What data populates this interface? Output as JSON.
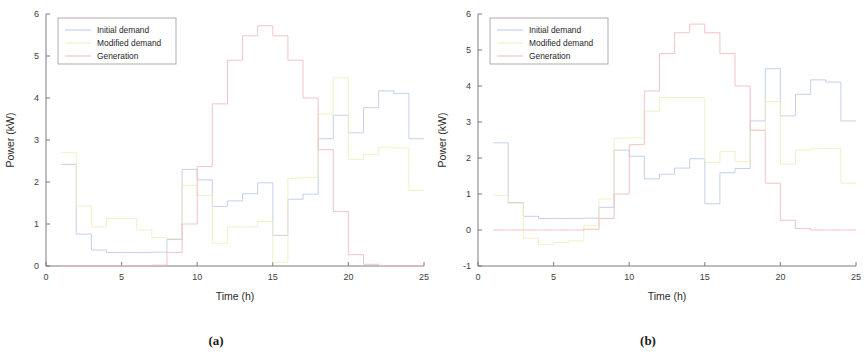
{
  "figure": {
    "panels": [
      {
        "caption": "(a)",
        "xlabel": "Time (h)",
        "ylabel": "Power (kW)",
        "xticks": [
          "0",
          "5",
          "10",
          "15",
          "20",
          "25"
        ],
        "yticks": [
          "0",
          "1",
          "2",
          "3",
          "4",
          "5",
          "6"
        ]
      },
      {
        "caption": "(b)",
        "xlabel": "Time (h)",
        "ylabel": "Power (kW)",
        "xticks": [
          "0",
          "5",
          "10",
          "15",
          "20",
          "25"
        ],
        "yticks": [
          "-1",
          "0",
          "1",
          "2",
          "3",
          "4",
          "5",
          "6"
        ]
      }
    ],
    "legend": {
      "entries": [
        {
          "label": "Initial demand",
          "color": "#b9c8e8"
        },
        {
          "label": "Modified demand",
          "color": "#eeedbe"
        },
        {
          "label": "Generation",
          "color": "#eeb9bb"
        }
      ]
    }
  },
  "chart_data": [
    {
      "type": "line",
      "title": "(a)",
      "xlabel": "Time (h)",
      "ylabel": "Power (kW)",
      "xlim": [
        0,
        25
      ],
      "ylim": [
        0,
        6
      ],
      "xticks": [
        0,
        5,
        10,
        15,
        20,
        25
      ],
      "yticks": [
        0,
        1,
        2,
        3,
        4,
        5,
        6
      ],
      "grid": false,
      "legend_position": "upper-left",
      "step_style": "post",
      "x": [
        1,
        2,
        3,
        4,
        5,
        6,
        7,
        8,
        9,
        10,
        11,
        12,
        13,
        14,
        15,
        16,
        17,
        18,
        19,
        20,
        21,
        22,
        23,
        24
      ],
      "series": [
        {
          "name": "Initial demand",
          "color": "#b9c8e8",
          "values": [
            2.42,
            0.76,
            0.38,
            0.32,
            0.32,
            0.32,
            0.33,
            0.63,
            2.3,
            2.05,
            1.42,
            1.55,
            1.72,
            1.98,
            0.73,
            1.59,
            1.71,
            3.03,
            3.59,
            3.17,
            3.77,
            4.17,
            4.11,
            3.03
          ]
        },
        {
          "name": "Modified demand",
          "color": "#eeedbe",
          "values": [
            2.7,
            1.43,
            0.93,
            1.13,
            1.13,
            0.86,
            0.68,
            0.65,
            1.92,
            1.68,
            0.54,
            0.93,
            0.93,
            1.06,
            0.09,
            2.09,
            2.11,
            3.62,
            4.48,
            2.54,
            2.66,
            2.83,
            2.81,
            1.8
          ]
        },
        {
          "name": "Generation",
          "color": "#eeb9bb",
          "values": [
            0.0,
            0.0,
            0.0,
            0.0,
            0.0,
            0.0,
            0.02,
            0.32,
            1.0,
            2.37,
            3.86,
            4.9,
            5.48,
            5.72,
            5.48,
            4.9,
            4.0,
            2.77,
            1.3,
            0.27,
            0.04,
            0.0,
            0.0,
            0.0
          ]
        }
      ]
    },
    {
      "type": "line",
      "title": "(b)",
      "xlabel": "Time (h)",
      "ylabel": "Power (kW)",
      "xlim": [
        0,
        25
      ],
      "ylim": [
        -1,
        6
      ],
      "xticks": [
        0,
        5,
        10,
        15,
        20,
        25
      ],
      "yticks": [
        -1,
        0,
        1,
        2,
        3,
        4,
        5,
        6
      ],
      "grid": false,
      "legend_position": "upper-left",
      "step_style": "post",
      "x": [
        1,
        2,
        3,
        4,
        5,
        6,
        7,
        8,
        9,
        10,
        11,
        12,
        13,
        14,
        15,
        16,
        17,
        18,
        19,
        20,
        21,
        22,
        23,
        24
      ],
      "series": [
        {
          "name": "Initial demand",
          "color": "#b9c8e8",
          "values": [
            2.42,
            0.76,
            0.38,
            0.32,
            0.32,
            0.32,
            0.33,
            0.63,
            2.22,
            2.05,
            1.42,
            1.55,
            1.72,
            1.98,
            0.73,
            1.59,
            1.71,
            3.03,
            4.48,
            3.17,
            3.77,
            4.17,
            4.11,
            3.03
          ]
        },
        {
          "name": "Modified demand",
          "color": "#eeedbe",
          "values": [
            0.96,
            0.74,
            -0.23,
            -0.4,
            -0.35,
            -0.3,
            0.12,
            0.86,
            2.55,
            2.56,
            3.3,
            3.68,
            3.68,
            3.68,
            1.88,
            2.18,
            1.9,
            2.77,
            3.57,
            1.83,
            2.22,
            2.27,
            2.27,
            1.3
          ]
        },
        {
          "name": "Generation",
          "color": "#eeb9bb",
          "values": [
            0.0,
            0.0,
            0.0,
            0.0,
            0.0,
            0.0,
            0.02,
            0.32,
            1.0,
            2.37,
            3.86,
            4.9,
            5.48,
            5.72,
            5.48,
            4.9,
            4.0,
            2.77,
            1.3,
            0.27,
            0.04,
            0.0,
            0.0,
            0.0
          ]
        }
      ]
    }
  ]
}
